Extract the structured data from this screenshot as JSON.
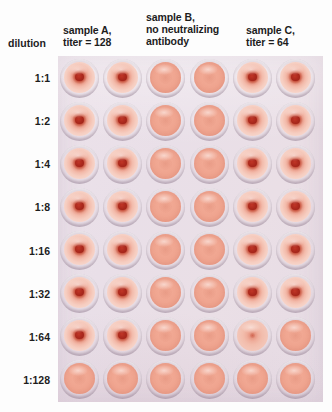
{
  "figure": {
    "kind": "hemagglutination-inhibition-assay-plate",
    "row_axis_label": "dilution",
    "columns": {
      "headers": [
        {
          "id": "sample-a",
          "label": "sample A,\ntiter = 128",
          "spans_columns": [
            1,
            2
          ]
        },
        {
          "id": "sample-b",
          "label": "sample B,\nno neutralizing\nantibody",
          "spans_columns": [
            3,
            4
          ]
        },
        {
          "id": "sample-c",
          "label": "sample C,\ntiter = 64",
          "spans_columns": [
            5,
            6
          ]
        }
      ],
      "count": 6
    },
    "rows": [
      {
        "label": "1:1"
      },
      {
        "label": "1:2"
      },
      {
        "label": "1:4"
      },
      {
        "label": "1:8"
      },
      {
        "label": "1:16"
      },
      {
        "label": "1:32"
      },
      {
        "label": "1:64"
      },
      {
        "label": "1:128"
      }
    ],
    "well_states": [
      [
        "button",
        "button",
        "shield",
        "shield",
        "button",
        "button"
      ],
      [
        "button",
        "button",
        "shield",
        "shield",
        "button",
        "button"
      ],
      [
        "button",
        "button",
        "shield",
        "shield",
        "button",
        "button"
      ],
      [
        "button",
        "button",
        "shield",
        "shield",
        "button",
        "button"
      ],
      [
        "button",
        "button",
        "shield",
        "shield",
        "button",
        "button"
      ],
      [
        "button",
        "button",
        "shield",
        "shield",
        "button",
        "button"
      ],
      [
        "button",
        "button",
        "shield",
        "shield",
        "weak",
        "shield"
      ],
      [
        "shield",
        "shield",
        "shield",
        "shield",
        "shield",
        "shield"
      ]
    ],
    "colors": {
      "plate_background": "#e9dfe8",
      "button_center": "#a9281c",
      "button_halo": "#f3bcac",
      "shield_fill": "#efa48f",
      "text": "#1d1d1d",
      "page_background": "#fdfdfd"
    }
  }
}
